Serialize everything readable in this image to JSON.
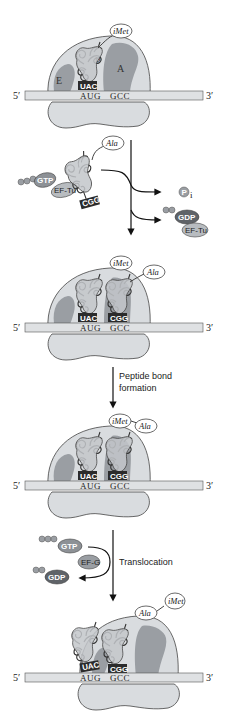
{
  "colors": {
    "ribosome_fill": "#d9dcdf",
    "ribosome_stroke": "#444444",
    "site_fill": "#9a9ea3",
    "mrna_fill": "#dfe1e3",
    "anticodon_fill": "#2b2b2b",
    "gtp_fill": "#8d9196",
    "gdp_fill": "#5f6368",
    "eftu_fill": "#b8bcc0",
    "arrow": "#111111"
  },
  "mrna": {
    "five_prime": "5′",
    "three_prime": "3′"
  },
  "panels": [
    {
      "id": "initiation",
      "sites": {
        "e": "E",
        "p": "P",
        "a": "A"
      },
      "trnas": [
        {
          "anticodon": "UAC",
          "amino_acid": "iMet"
        }
      ],
      "codons": [
        "AUG",
        "GCC"
      ]
    },
    {
      "id": "aminoacyl-binding",
      "trnas": [
        {
          "anticodon": "UAC",
          "amino_acid": "iMet"
        },
        {
          "anticodon": "CGG",
          "amino_acid": "Ala"
        }
      ],
      "codons": [
        "AUG",
        "GCC"
      ]
    },
    {
      "id": "after-peptide-bond",
      "trnas": [
        {
          "anticodon": "UAC",
          "amino_acid": ""
        },
        {
          "anticodon": "CGG",
          "amino_acid": "Ala"
        }
      ],
      "chain": [
        "iMet",
        "Ala"
      ],
      "codons": [
        "AUG",
        "GCC"
      ]
    },
    {
      "id": "after-translocation",
      "trnas": [
        {
          "anticodon": "UAC",
          "amino_acid": ""
        },
        {
          "anticodon": "CGG",
          "amino_acid": ""
        }
      ],
      "chain": [
        "Ala",
        "iMet"
      ],
      "codons": [
        "AUG",
        "GCC"
      ]
    }
  ],
  "incoming_complex": {
    "gtp": "GTP",
    "ef_tu": "EF-Tu",
    "anticodon": "CGG",
    "amino_acid": "Ala"
  },
  "released": {
    "pi": "P",
    "pi_sub": "i",
    "gdp": "GDP",
    "ef_tu": "EF-Tu"
  },
  "steps": {
    "peptide_bond_line1": "Peptide bond",
    "peptide_bond_line2": "formation",
    "translocation": "Translocation"
  },
  "translocation_factors": {
    "gtp": "GTP",
    "ef_g": "EF-G",
    "gdp": "GDP"
  }
}
